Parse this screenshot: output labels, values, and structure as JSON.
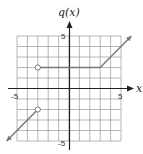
{
  "chart_data": {
    "type": "line",
    "title": "q(x)",
    "xlabel": "x",
    "ylabel": "q(x)",
    "xlim": [
      -5,
      5
    ],
    "ylim": [
      -5,
      5
    ],
    "grid": true,
    "tick_labels": {
      "x": [
        "-5",
        "5"
      ],
      "y": [
        "5",
        "-5"
      ]
    },
    "series": [
      {
        "name": "left-piece",
        "points": [
          [
            -6,
            -5
          ],
          [
            -3,
            -2
          ]
        ],
        "end_open": true,
        "start_arrow": true
      },
      {
        "name": "middle-piece",
        "points": [
          [
            -3,
            2
          ],
          [
            3,
            2
          ]
        ],
        "start_open": true
      },
      {
        "name": "right-piece",
        "points": [
          [
            3,
            2
          ],
          [
            6,
            5
          ]
        ],
        "end_arrow": true
      }
    ],
    "open_circles": [
      [
        -3,
        2
      ],
      [
        -3,
        -2
      ]
    ],
    "line_color": "#777777",
    "grid_color": "#999999"
  },
  "labels": {
    "y_axis": "q(x)",
    "x_axis": "x",
    "x_min": "-5",
    "x_max": "5",
    "y_max": "5",
    "y_min": "-5"
  }
}
